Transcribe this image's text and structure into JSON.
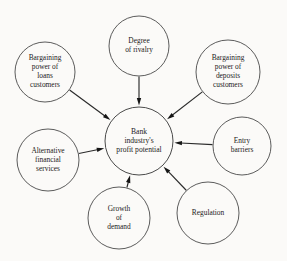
{
  "diagram": {
    "type": "hub-and-spoke",
    "background_color": "#fbfaf8",
    "stroke_color": "#4a4a4a",
    "arrow_color": "#151515",
    "text_color": "#1b1b1b",
    "center": {
      "id": "center",
      "name": "bank-industry-profit-potential",
      "lines": [
        "Bank",
        "industry's",
        "profit potential"
      ],
      "cx": 139,
      "cy": 141,
      "r": 34
    },
    "nodes": [
      {
        "id": "degree-of-rivalry",
        "lines": [
          "Degree",
          "of rivalry"
        ],
        "cx": 139,
        "cy": 46,
        "r": 30,
        "arrow_from_angle": 90
      },
      {
        "id": "bargaining-power-of-deposits-customers",
        "lines": [
          "Bargaining",
          "power of",
          "deposits",
          "customers"
        ],
        "cx": 228,
        "cy": 72,
        "r": 32,
        "arrow_from_angle": 45
      },
      {
        "id": "entry-barriers",
        "lines": [
          "Entry",
          "barriers"
        ],
        "cx": 242,
        "cy": 146,
        "r": 29,
        "arrow_from_angle": 0
      },
      {
        "id": "regulation",
        "lines": [
          "Regulation"
        ],
        "cx": 208,
        "cy": 213,
        "r": 31,
        "arrow_from_angle": -48
      },
      {
        "id": "growth-of-demand",
        "lines": [
          "Growth",
          "of",
          "demand"
        ],
        "cx": 119,
        "cy": 218,
        "r": 31,
        "arrow_from_angle": -95
      },
      {
        "id": "alternative-financial-services",
        "lines": [
          "Alternative",
          "financial",
          "services"
        ],
        "cx": 48,
        "cy": 160,
        "r": 31,
        "arrow_from_angle": 184
      },
      {
        "id": "bargaining-power-of-loans-customers",
        "lines": [
          "Bargaining",
          "power of",
          "loans",
          "customers"
        ],
        "cx": 45,
        "cy": 72,
        "r": 30,
        "arrow_from_angle": 135
      }
    ]
  }
}
